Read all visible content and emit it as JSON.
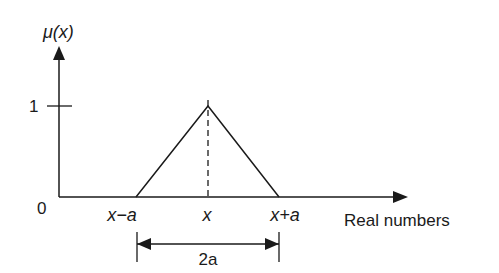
{
  "diagram": {
    "type": "triangular-membership-function",
    "y_axis": {
      "label": "μ(x)",
      "ticks": [
        {
          "value": "1"
        }
      ]
    },
    "x_axis": {
      "label": "Real numbers",
      "origin_label": "0"
    },
    "points": {
      "left": "x−a",
      "center": "x",
      "right": "x+a"
    },
    "width_annotation": "2a",
    "colors": {
      "stroke": "#1a1a1a",
      "background": "#ffffff"
    }
  }
}
